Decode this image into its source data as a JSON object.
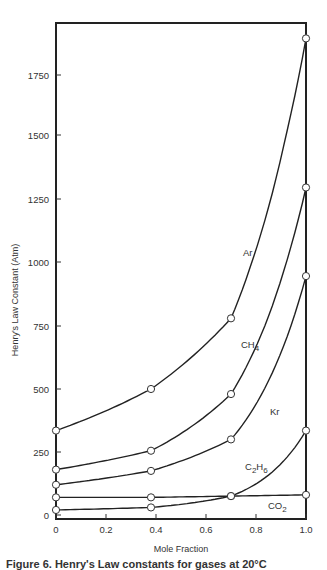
{
  "header_fragment": "",
  "caption": "Figure 6. Henry's Law constants for gases at 20°C",
  "chart_data": {
    "type": "line",
    "title": "",
    "xlabel": "Mole Fraction",
    "ylabel": "Henry's Law Constant (Atm)",
    "xlim": [
      0,
      1.0
    ],
    "ylim": [
      0,
      1900
    ],
    "x_ticks": [
      "0",
      "0.2",
      "0.4",
      "0.6",
      "0.8",
      "1.0"
    ],
    "y_ticks": [
      "0",
      "250",
      "500",
      "750",
      "1000",
      "1250",
      "1500",
      "1750"
    ],
    "grid": false,
    "legend": "inline labels",
    "series": [
      {
        "name": "Ar",
        "x": [
          0,
          0.38,
          0.7,
          1.0
        ],
        "values": [
          335,
          500,
          780,
          1900
        ]
      },
      {
        "name": "CH4",
        "x": [
          0,
          0.38,
          0.7,
          1.0
        ],
        "values": [
          180,
          255,
          480,
          1295
        ]
      },
      {
        "name": "Kr",
        "x": [
          0,
          0.38,
          0.7,
          1.0
        ],
        "values": [
          120,
          175,
          300,
          945
        ]
      },
      {
        "name": "C2H6",
        "x": [
          0,
          0.38,
          0.7,
          1.0
        ],
        "values": [
          20,
          30,
          75,
          335
        ]
      },
      {
        "name": "CO2",
        "x": [
          0,
          0.38,
          0.7,
          1.0
        ],
        "values": [
          70,
          70,
          75,
          80
        ]
      }
    ]
  }
}
